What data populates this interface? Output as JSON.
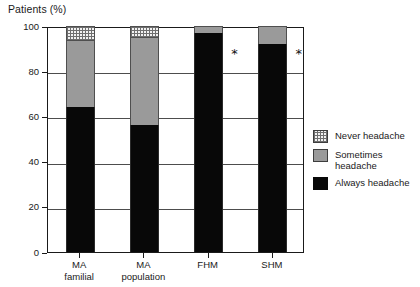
{
  "chart_data": {
    "type": "bar",
    "title": "Patients (%)",
    "xlabel": "",
    "ylabel": "Patients (%)",
    "ylim": [
      0,
      100
    ],
    "yticks": [
      0,
      20,
      40,
      60,
      80,
      100
    ],
    "grid": true,
    "stacked": true,
    "legend_position": "right",
    "categories": [
      "MA\nfamilial",
      "MA\npopulation",
      "FHM",
      "SHM"
    ],
    "category_labels_flat": [
      "MA familial",
      "MA population",
      "FHM",
      "SHM"
    ],
    "series": [
      {
        "name": "Always headache",
        "color": "#080808",
        "values": [
          64,
          56,
          97,
          92
        ]
      },
      {
        "name": "Sometimes headache",
        "color": "#9a9a9a",
        "values": [
          30,
          39,
          3,
          8
        ]
      },
      {
        "name": "Never headache",
        "color": "#f2f2f2",
        "values": [
          6,
          5,
          0,
          0
        ]
      }
    ],
    "annotations": [
      {
        "text": "*",
        "category": "FHM",
        "y": 88
      },
      {
        "text": "*",
        "category": "SHM",
        "y": 88
      }
    ]
  },
  "axis": {
    "y_tick_labels": [
      "100",
      "80",
      "60",
      "40",
      "20",
      "0"
    ],
    "y_tick_values": [
      100,
      80,
      60,
      40,
      20,
      0
    ]
  },
  "categories": [
    {
      "line1": "MA",
      "line2": "familial"
    },
    {
      "line1": "MA",
      "line2": "population"
    },
    {
      "line1": "FHM",
      "line2": ""
    },
    {
      "line1": "SHM",
      "line2": ""
    }
  ],
  "legend": {
    "items": [
      {
        "label": "Never headache",
        "swatch": "dotted-swatch"
      },
      {
        "label": "Sometimes\nheadache",
        "swatch": "gray-swatch"
      },
      {
        "label": "Always headache",
        "swatch": "black-swatch"
      }
    ]
  },
  "annotations": {
    "fhm_star": "*",
    "shm_star": "*"
  }
}
